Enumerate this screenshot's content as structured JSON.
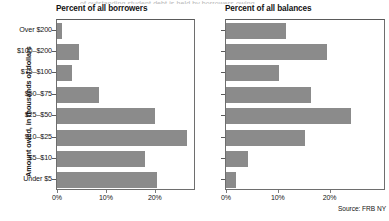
{
  "figure": {
    "clipped_top_text": "of outstanding student debt is held by borrowers owing",
    "source": "Source: FRB NY",
    "bar_color": "#8b8b8b",
    "axis_color": "#6e6e6e"
  },
  "yaxis": {
    "title": "Amount owed, in thousands of dollars",
    "categories": [
      "Over $200",
      "$100–$200",
      "$75–$100",
      "$50–$75",
      "$25–$50",
      "$10–$25",
      "$5–$10",
      "Under $5"
    ]
  },
  "xaxis": {
    "ticks": [
      "0%",
      "10%",
      "20%"
    ],
    "tick_values": [
      0,
      10,
      20
    ]
  },
  "panels": [
    {
      "id": "borrowers",
      "title": "Percent of all borrowers"
    },
    {
      "id": "balances",
      "title": "Percent of all balances"
    }
  ],
  "chart_data": [
    {
      "type": "bar",
      "orientation": "horizontal",
      "title": "Percent of all borrowers",
      "xlabel": "",
      "ylabel": "Amount owed, in thousands of dollars",
      "categories": [
        "Over $200",
        "$100–$200",
        "$75–$100",
        "$50–$75",
        "$25–$50",
        "$10–$25",
        "$5–$10",
        "Under $5"
      ],
      "values": [
        1.0,
        4.5,
        3.0,
        8.5,
        20.0,
        26.5,
        18.0,
        20.5
      ],
      "xlim": [
        0,
        28
      ],
      "xticks": [
        0,
        10,
        20
      ],
      "xticklabels": [
        "0%",
        "10%",
        "20%"
      ],
      "grid": false,
      "legend": "none",
      "units": "percent"
    },
    {
      "type": "bar",
      "orientation": "horizontal",
      "title": "Percent of all balances",
      "xlabel": "",
      "ylabel": "Amount owed, in thousands of dollars",
      "categories": [
        "Over $200",
        "$100–$200",
        "$75–$100",
        "$50–$75",
        "$25–$50",
        "$10–$25",
        "$5–$10",
        "Under $5"
      ],
      "values": [
        11.5,
        19.5,
        10.3,
        16.5,
        24.2,
        15.3,
        4.2,
        2.0
      ],
      "xlim": [
        0,
        30.5
      ],
      "xticks": [
        0,
        10,
        20
      ],
      "xticklabels": [
        "0%",
        "10%",
        "20%"
      ],
      "grid": false,
      "legend": "none",
      "units": "percent"
    }
  ]
}
